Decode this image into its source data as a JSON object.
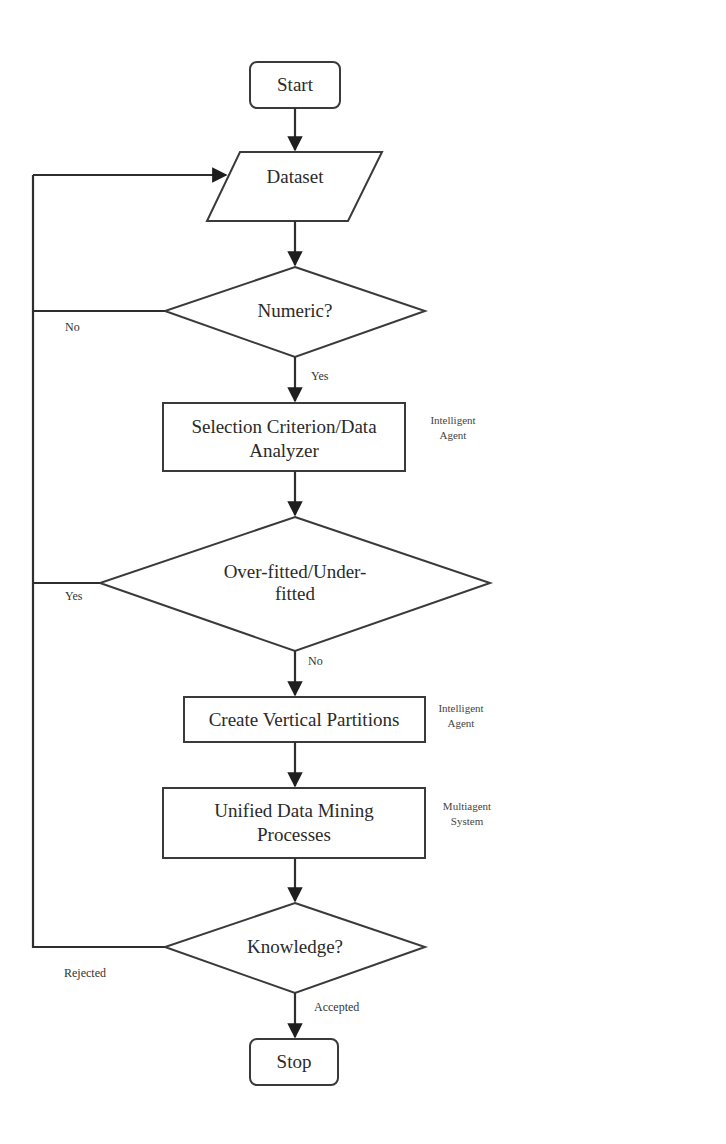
{
  "diagram": {
    "type": "flowchart",
    "nodes": {
      "start": {
        "label": "Start",
        "shape": "terminator"
      },
      "dataset": {
        "label": "Dataset",
        "shape": "parallelogram"
      },
      "numeric": {
        "label": "Numeric?",
        "shape": "decision"
      },
      "selection": {
        "line1": "Selection Criterion/Data",
        "line2": "Analyzer",
        "shape": "process",
        "note_line1": "Intelligent",
        "note_line2": "Agent"
      },
      "fit": {
        "line1": "Over-fitted/Under-",
        "line2": "fitted",
        "shape": "decision"
      },
      "partitions": {
        "label": "Create Vertical Partitions",
        "shape": "process",
        "note_line1": "Intelligent",
        "note_line2": "Agent"
      },
      "mining": {
        "line1": "Unified Data Mining",
        "line2": "Processes",
        "shape": "process",
        "note_line1": "Multiagent",
        "note_line2": "System"
      },
      "knowledge": {
        "label": "Knowledge?",
        "shape": "decision"
      },
      "stop": {
        "label": "Stop",
        "shape": "terminator"
      }
    },
    "edge_labels": {
      "numeric_no": "No",
      "numeric_yes": "Yes",
      "fit_yes": "Yes",
      "fit_no": "No",
      "knowledge_rejected": "Rejected",
      "knowledge_accepted": "Accepted"
    },
    "edges": [
      {
        "from": "start",
        "to": "dataset"
      },
      {
        "from": "dataset",
        "to": "numeric"
      },
      {
        "from": "numeric",
        "to": "selection",
        "label": "Yes"
      },
      {
        "from": "numeric",
        "to": "dataset",
        "label": "No"
      },
      {
        "from": "selection",
        "to": "fit"
      },
      {
        "from": "fit",
        "to": "partitions",
        "label": "No"
      },
      {
        "from": "fit",
        "to": "dataset",
        "label": "Yes"
      },
      {
        "from": "partitions",
        "to": "mining"
      },
      {
        "from": "mining",
        "to": "knowledge"
      },
      {
        "from": "knowledge",
        "to": "stop",
        "label": "Accepted"
      },
      {
        "from": "knowledge",
        "to": "dataset",
        "label": "Rejected"
      }
    ],
    "colors": {
      "stroke": "#3a3a3a",
      "text": "#2a2a2a",
      "background": "#ffffff"
    }
  }
}
